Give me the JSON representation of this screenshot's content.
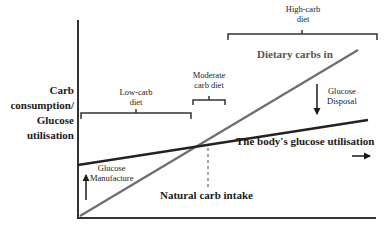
{
  "diagram": {
    "y_axis_label_lines": [
      "Carb",
      "consumption/",
      "Glucose",
      "utilisation"
    ],
    "brackets": {
      "low_carb": [
        "Low-carb",
        "diet"
      ],
      "moderate_carb": [
        "Moderate",
        "carb diet"
      ],
      "high_carb": [
        "High-carb",
        "diet"
      ]
    },
    "lines": {
      "dietary_carbs": {
        "label": "Dietary carbs in",
        "color": "#6e6e6e"
      },
      "glucose_utilisation": {
        "label": "The body's glucose utilisation",
        "color": "#222222"
      }
    },
    "annotations": {
      "glucose_disposal": [
        "Glucose",
        "Disposal"
      ],
      "glucose_manufacture": [
        "Glucose",
        "Manufacture"
      ],
      "natural_carb_intake": "Natural carb intake"
    },
    "colors": {
      "axis": "#333333",
      "text": "#1a1a1a",
      "background": "#ffffff"
    }
  }
}
